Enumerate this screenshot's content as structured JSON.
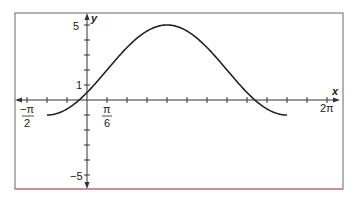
{
  "chart_data": {
    "type": "line",
    "title": "",
    "function": "y = 2 + 3 sin(x - π/6)",
    "xlabel": "x",
    "ylabel": "y",
    "x_domain": [
      -1.0472,
      5.236
    ],
    "xlim": [
      -1.6,
      6.5
    ],
    "ylim": [
      -5.8,
      5.8
    ],
    "x_tick_step": "π/6",
    "y_tick_step": 1,
    "x_tick_labels": [
      {
        "value": -1.5708,
        "text_num": "−π",
        "text_den": "2"
      },
      {
        "value": 0.5236,
        "text_num": "π",
        "text_den": "6"
      },
      {
        "value": 6.2832,
        "text": "2π"
      }
    ],
    "y_tick_labels": [
      {
        "value": 5,
        "text": "5"
      },
      {
        "value": 1,
        "text": "1"
      },
      {
        "value": -5,
        "text": "−5"
      }
    ],
    "series": [
      {
        "name": "y = 2 + 3 sin(x − π/6)",
        "x": [
          -1.0472,
          -0.5236,
          0,
          0.5236,
          1.0472,
          1.5708,
          2.0944,
          2.618,
          3.1416,
          3.6652,
          4.1888,
          4.7124,
          5.236
        ],
        "values": [
          -1,
          -0.6,
          0.5,
          2,
          3.5,
          4.6,
          5,
          4.6,
          3.5,
          2,
          0.5,
          -0.6,
          -1
        ]
      }
    ],
    "grid": false,
    "legend": null,
    "colors": {
      "curve": "#222222",
      "frame": "#555555",
      "bottom_border": "#d9727f"
    }
  },
  "axes": {
    "x_label": "x",
    "y_label": "y"
  }
}
